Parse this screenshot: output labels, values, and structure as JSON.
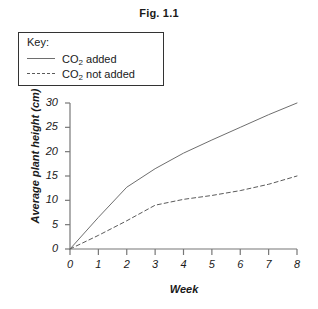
{
  "title": "Fig. 1.1",
  "legend": {
    "heading": "Key:",
    "entries": [
      {
        "label_prefix": "CO",
        "label_sub": "2",
        "label_suffix": " added",
        "style": "solid"
      },
      {
        "label_prefix": "CO",
        "label_sub": "2",
        "label_suffix": " not added",
        "style": "dashed"
      }
    ]
  },
  "chart_data": {
    "type": "line",
    "title": "Fig. 1.1",
    "xlabel": "Week",
    "ylabel": "Average plant height (cm)",
    "xlim": [
      0,
      8
    ],
    "ylim": [
      0,
      30
    ],
    "xticks": [
      "0",
      "1",
      "2",
      "3",
      "4",
      "5",
      "6",
      "7",
      "8"
    ],
    "yticks": [
      "0",
      "5",
      "10",
      "15",
      "20",
      "25",
      "30"
    ],
    "grid": false,
    "legend_position": "top-left",
    "x": [
      0,
      1,
      2,
      3,
      4,
      5,
      6,
      7,
      8
    ],
    "series": [
      {
        "name": "CO2 added",
        "style": "solid",
        "color": "#6e6e6e",
        "values": [
          0,
          6.5,
          12.7,
          16.5,
          19.7,
          22.4,
          25.0,
          27.6,
          30.0
        ]
      },
      {
        "name": "CO2 not added",
        "style": "dashed",
        "color": "#5a5a5a",
        "values": [
          0,
          2.8,
          5.8,
          9.0,
          10.2,
          11.0,
          12.0,
          13.3,
          15.0
        ]
      }
    ]
  },
  "axis_colors": {
    "axis_line": "#777777",
    "text": "#1a1a1a"
  }
}
